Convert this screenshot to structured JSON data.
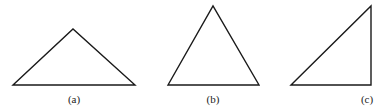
{
  "figures": [
    {
      "id": "a",
      "label": "(a)",
      "shape": "obtuse triangle",
      "points": [
        [
          13,
          85
        ],
        [
          73,
          29
        ],
        [
          135,
          85
        ]
      ],
      "label_pos": [
        74,
        103
      ]
    },
    {
      "id": "b",
      "label": "(b)",
      "shape": "acute triangle",
      "points": [
        [
          168,
          85
        ],
        [
          213,
          6
        ],
        [
          259,
          85
        ]
      ],
      "label_pos": [
        213,
        103
      ]
    },
    {
      "id": "c",
      "label": "(c)",
      "shape": "right triangle",
      "points": [
        [
          291,
          85
        ],
        [
          371,
          6
        ],
        [
          371,
          85
        ]
      ],
      "label_pos": [
        367,
        103
      ]
    }
  ],
  "colors": {
    "stroke": "#1a1a1a",
    "background": "#ffffff"
  }
}
